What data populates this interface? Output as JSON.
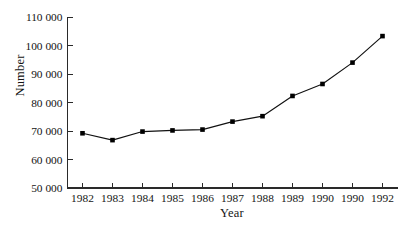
{
  "chart_data": {
    "type": "line",
    "title": "",
    "xlabel": "Year",
    "ylabel": "Number",
    "x": [
      1982,
      1983,
      1984,
      1985,
      1986,
      1987,
      1988,
      1989,
      1990,
      1991,
      1992
    ],
    "xtick_labels": [
      "1982",
      "1983",
      "1984",
      "1985",
      "1986",
      "1987",
      "1988",
      "1989",
      "1990",
      "1990",
      "1992"
    ],
    "values": [
      69200,
      66800,
      69800,
      70200,
      70500,
      73300,
      75200,
      82300,
      86500,
      94000,
      103300
    ],
    "ytick_labels": [
      "110 000",
      "100 000",
      "90 000",
      "80 000",
      "70 000",
      "60 000",
      "50 000"
    ],
    "ytick_values": [
      110000,
      100000,
      90000,
      80000,
      70000,
      60000,
      50000
    ],
    "ylim": [
      50000,
      110000
    ],
    "grid": false,
    "legend": false,
    "marker": "square",
    "line_color": "#111111",
    "marker_color": "#000000",
    "axis_color": "#2a2a2a",
    "background": "#ffffff"
  }
}
